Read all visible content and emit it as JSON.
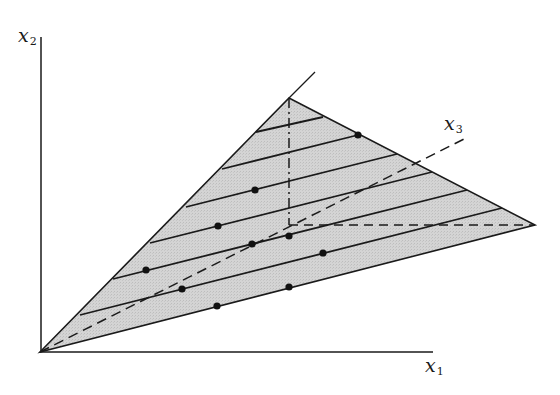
{
  "diagram": {
    "title": "",
    "colors": {
      "background": "#ffffff",
      "ink": "#1a1a1a",
      "region_fill": "#d2d2d2"
    },
    "axes": {
      "x1": {
        "label_main": "x",
        "label_sub": "1",
        "start": [
          40,
          352
        ],
        "end": [
          433,
          352
        ],
        "label_pos": [
          425,
          356
        ]
      },
      "x2": {
        "label_main": "x",
        "label_sub": "2",
        "start": [
          41,
          352
        ],
        "end": [
          41,
          37
        ],
        "label_pos": [
          18,
          26
        ]
      },
      "x3": {
        "label_main": "x",
        "label_sub": "3",
        "start": [
          40,
          352
        ],
        "end": [
          468,
          137
        ],
        "style": "dashed",
        "label_pos": [
          444,
          114
        ]
      }
    },
    "region": {
      "shape": "triangle",
      "vertices": [
        [
          40,
          352
        ],
        [
          289,
          98
        ],
        [
          535,
          225
        ]
      ],
      "extension_line": {
        "from": [
          289,
          98
        ],
        "to": [
          315,
          72
        ]
      }
    },
    "projection_lines": [
      {
        "from": [
          289,
          98
        ],
        "to": [
          289,
          225
        ],
        "style": "dash-dot"
      },
      {
        "from": [
          289,
          225
        ],
        "to": [
          535,
          225
        ],
        "style": "dashed"
      },
      {
        "from": [
          289,
          225
        ],
        "to": [
          40,
          352
        ],
        "style": "dashed-segment-note",
        "note": "part of x3 axis"
      }
    ],
    "parallel_lines": [
      {
        "from": [
          256,
          132
        ],
        "to": [
          323,
          117
        ]
      },
      {
        "from": [
          222,
          169
        ],
        "to": [
          358,
          135
        ]
      },
      {
        "from": [
          186,
          207
        ],
        "to": [
          397,
          154
        ]
      },
      {
        "from": [
          150,
          243
        ],
        "to": [
          432,
          172
        ]
      },
      {
        "from": [
          113,
          279
        ],
        "to": [
          467,
          190
        ]
      },
      {
        "from": [
          80,
          315
        ],
        "to": [
          502,
          208
        ]
      }
    ],
    "points": [
      [
        358,
        135
      ],
      [
        255,
        190
      ],
      [
        218,
        226
      ],
      [
        289,
        236
      ],
      [
        252,
        244
      ],
      [
        146,
        270
      ],
      [
        323,
        253
      ],
      [
        182,
        289
      ],
      [
        289,
        287
      ],
      [
        217,
        306
      ]
    ]
  }
}
